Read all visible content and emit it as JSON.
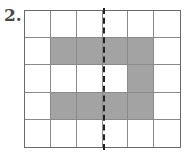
{
  "problem": {
    "number": "2."
  },
  "grid": {
    "rows": 5,
    "cols": 6,
    "shaded_color": "#a3a3a3",
    "cells": [
      [
        0,
        0,
        0,
        0,
        0,
        0
      ],
      [
        0,
        1,
        1,
        1,
        1,
        0
      ],
      [
        0,
        0,
        0,
        0,
        1,
        0
      ],
      [
        0,
        1,
        1,
        1,
        1,
        0
      ],
      [
        0,
        0,
        0,
        0,
        0,
        0
      ]
    ]
  },
  "line_of_symmetry": {
    "style": "dashed",
    "position": "vertical, between column 3 and column 4"
  }
}
